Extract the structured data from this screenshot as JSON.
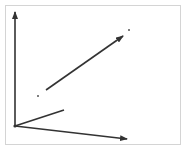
{
  "diagram": {
    "type": "vector-diagram",
    "frame": {
      "x": 5,
      "y": 5,
      "width": 176,
      "height": 140,
      "border_color": "#d4d4d4"
    },
    "stroke_color": "#333333",
    "origin": {
      "x": 15,
      "y": 126
    },
    "axes": [
      {
        "name": "y-axis",
        "from": [
          15,
          126
        ],
        "to": [
          15,
          12
        ],
        "arrow": true
      },
      {
        "name": "x-axis",
        "from": [
          15,
          126
        ],
        "to": [
          127,
          139
        ],
        "arrow": true
      }
    ],
    "vectors": [
      {
        "name": "short-vector",
        "from": [
          15,
          126
        ],
        "to": [
          64,
          110
        ],
        "arrow": false
      },
      {
        "name": "long-vector",
        "from": [
          46,
          90
        ],
        "to": [
          123,
          36
        ],
        "arrow": true
      }
    ],
    "points": [
      {
        "name": "point-a",
        "x": 38,
        "y": 96
      },
      {
        "name": "point-b",
        "x": 129,
        "y": 30
      }
    ]
  }
}
